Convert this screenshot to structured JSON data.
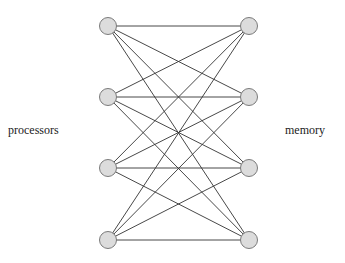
{
  "labels": {
    "left": "processors",
    "right": "memory"
  },
  "nodes": {
    "processors": [
      {
        "id": "p1",
        "x": 108,
        "y": 26
      },
      {
        "id": "p2",
        "x": 108,
        "y": 97
      },
      {
        "id": "p3",
        "x": 108,
        "y": 168
      },
      {
        "id": "p4",
        "x": 108,
        "y": 240
      }
    ],
    "memory": [
      {
        "id": "m1",
        "x": 249,
        "y": 26
      },
      {
        "id": "m2",
        "x": 249,
        "y": 97
      },
      {
        "id": "m3",
        "x": 249,
        "y": 168
      },
      {
        "id": "m4",
        "x": 249,
        "y": 240
      }
    ]
  },
  "style": {
    "node_fill": "#dcdcdc",
    "node_stroke": "#7a7a7a",
    "edge_color": "#333333",
    "node_radius": 8.5
  },
  "edges": "complete-bipartite"
}
